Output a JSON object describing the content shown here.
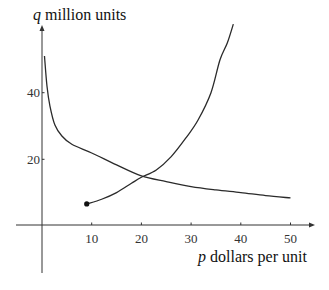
{
  "chart_data": {
    "type": "line",
    "title": "",
    "xlabel": {
      "variable": "p",
      "text": " dollars per unit"
    },
    "ylabel": {
      "variable": "q",
      "text": " million units"
    },
    "xlim": [
      -5,
      55
    ],
    "ylim": [
      -14,
      60
    ],
    "xticks": [
      10,
      20,
      30,
      40,
      50
    ],
    "yticks": [
      20,
      40
    ],
    "xtick_labels": [
      "10",
      "20",
      "30",
      "40",
      "50"
    ],
    "ytick_labels": [
      "20",
      "40"
    ],
    "grid": false,
    "series": [
      {
        "name": "demand",
        "points": [
          [
            0.5,
            51
          ],
          [
            1,
            42
          ],
          [
            1.6,
            36
          ],
          [
            2.6,
            30.3
          ],
          [
            4,
            27
          ],
          [
            6,
            24.5
          ],
          [
            10,
            21.9
          ],
          [
            15,
            18.3
          ],
          [
            20,
            15
          ],
          [
            25,
            13.3
          ],
          [
            30,
            11.8
          ],
          [
            35,
            10.8
          ],
          [
            40,
            10
          ],
          [
            45,
            9.1
          ],
          [
            50,
            8.4
          ]
        ]
      },
      {
        "name": "supply",
        "start_marker": true,
        "points": [
          [
            9,
            6.6
          ],
          [
            12,
            8
          ],
          [
            15,
            10
          ],
          [
            18,
            12.8
          ],
          [
            20,
            14.6
          ],
          [
            23,
            16.8
          ],
          [
            26,
            20.8
          ],
          [
            29,
            26.5
          ],
          [
            31.4,
            31.8
          ],
          [
            34,
            40
          ],
          [
            35.8,
            49.8
          ],
          [
            37.3,
            55
          ],
          [
            38.5,
            60.6
          ]
        ]
      }
    ]
  }
}
